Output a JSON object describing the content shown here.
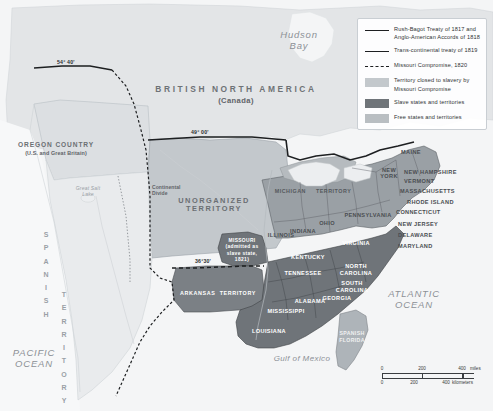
{
  "map": {
    "title": "Missouri Compromise of 1820",
    "colors": {
      "ocean": "#f4f5f6",
      "closed_to_slavery": "#c3c8cc",
      "slave_states": "#6f7479",
      "free_states": "#9aa0a5",
      "foreign": "#e3e5e7",
      "border": "#1d1f21"
    }
  },
  "legend": {
    "items": [
      {
        "key": "solid-line",
        "label": "Rush-Bagot Treaty of 1817 and\nAnglo-American Accords of 1818"
      },
      {
        "key": "solid-line",
        "label": "Trans-continental treaty of 1819"
      },
      {
        "key": "dashed-line",
        "label": "Missouri Compromise, 1820"
      },
      {
        "key": "swatch-light",
        "label": "Territory closed to slavery by\nMissouri Compromise",
        "color": "#c3c8cc"
      },
      {
        "key": "swatch-dark",
        "label": "Slave states and territories",
        "color": "#6f7479"
      },
      {
        "key": "swatch-mid",
        "label": "Free states and territories",
        "color": "#9aa0a5"
      }
    ]
  },
  "oceans": [
    {
      "name": "hudson-bay",
      "label": "Hudson\nBay"
    },
    {
      "name": "atlantic-ocean",
      "label": "ATLANTIC\nOCEAN"
    },
    {
      "name": "pacific-ocean",
      "label": "PACIFIC\nOCEAN"
    },
    {
      "name": "gulf-of-mexico",
      "label": "Gulf of Mexico"
    }
  ],
  "regions": {
    "british_north_america": {
      "label": "BRITISH NORTH AMERICA",
      "sub": "(Canada)"
    },
    "oregon_country": {
      "label": "OREGON COUNTRY",
      "sub": "(U.S. and Great Britain)"
    },
    "unorganized_territory": {
      "label": "UNORGANIZED\nTERRITORY"
    },
    "spanish_territory": {
      "label": "SPANISH TERRITORY"
    },
    "michigan_territory": {
      "label": "MICHIGAN     TERRITORY"
    },
    "arkansas_territory": {
      "label": "ARKANSAS  TERRITORY"
    },
    "missouri": {
      "label": "MISSOURI\n(admitted as\nslave state,\n1821)"
    },
    "spanish_florida": {
      "label": "SPANISH\nFLORIDA"
    }
  },
  "boundaries": [
    {
      "name": "lat-54-40",
      "label": "54° 40'"
    },
    {
      "name": "lat-49-00",
      "label": "49° 00'"
    },
    {
      "name": "lat-36-30",
      "label": "36°30'"
    }
  ],
  "physical": [
    {
      "name": "continental-divide",
      "label": "Continental\nDivide"
    },
    {
      "name": "great-salt-lake",
      "label": "Great Salt\nLake"
    }
  ],
  "states": [
    {
      "label": "MAINE",
      "tone": "light"
    },
    {
      "label": "NEW HAMPSHIRE",
      "tone": "light"
    },
    {
      "label": "VERMONT",
      "tone": "light"
    },
    {
      "label": "MASSACHUSETTS",
      "tone": "light"
    },
    {
      "label": "RHODE ISLAND",
      "tone": "light"
    },
    {
      "label": "CONNECTICUT",
      "tone": "light"
    },
    {
      "label": "NEW YORK",
      "tone": "light"
    },
    {
      "label": "NEW JERSEY",
      "tone": "light"
    },
    {
      "label": "DELAWARE",
      "tone": "light"
    },
    {
      "label": "MARYLAND",
      "tone": "light"
    },
    {
      "label": "PENNSYLVANIA",
      "tone": "light"
    },
    {
      "label": "OHIO",
      "tone": "light"
    },
    {
      "label": "INDIANA",
      "tone": "light"
    },
    {
      "label": "ILLINOIS",
      "tone": "light"
    },
    {
      "label": "VIRGINIA",
      "tone": "dark"
    },
    {
      "label": "KENTUCKY",
      "tone": "dark"
    },
    {
      "label": "TENNESSEE",
      "tone": "dark"
    },
    {
      "label": "NORTH\nCAROLINA",
      "tone": "dark"
    },
    {
      "label": "SOUTH\nCAROLINA",
      "tone": "dark"
    },
    {
      "label": "GEORGIA",
      "tone": "dark"
    },
    {
      "label": "ALABAMA",
      "tone": "dark"
    },
    {
      "label": "MISSISSIPPI",
      "tone": "dark"
    },
    {
      "label": "LOUISIANA",
      "tone": "dark"
    }
  ],
  "scale": {
    "miles": {
      "ticks": [
        "0",
        "200",
        "400"
      ],
      "unit": "miles"
    },
    "kilometers": {
      "ticks": [
        "0",
        "200",
        "400"
      ],
      "unit": "kilometers"
    }
  }
}
